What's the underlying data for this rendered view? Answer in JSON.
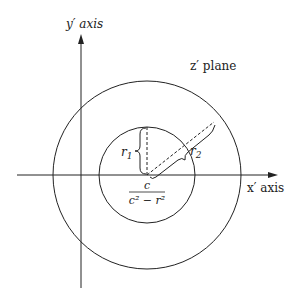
{
  "diagram": {
    "labels": {
      "y_axis": "y′ axis",
      "x_axis": "x′ axis",
      "plane": "z′ plane",
      "r1": "r",
      "r1_sub": "1",
      "r2": "r",
      "r2_sub": "2",
      "center_numerator": "c",
      "center_denominator": "c² − r²"
    },
    "geometry": {
      "center": [
        147,
        175
      ],
      "inner_radius": 48,
      "outer_radius": 94,
      "y_axis_x": 81,
      "x_axis_y": 175
    },
    "colors": {
      "stroke": "#222222",
      "background": "#ffffff"
    }
  }
}
